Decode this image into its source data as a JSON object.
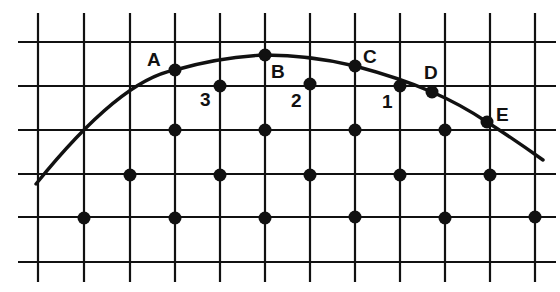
{
  "diagram": {
    "type": "grid-with-curve",
    "grid": {
      "vertical_lines_x": [
        38,
        84,
        130,
        175,
        220,
        265,
        310,
        355,
        400,
        445,
        490,
        535
      ],
      "horizontal_lines_y": [
        42,
        86,
        130,
        174,
        217,
        262
      ],
      "line_color": "#111111"
    },
    "curve": {
      "path": "M 36 184 Q 120 80 175 70 Q 220 57 265 55 Q 310 55 355 66 Q 400 78 432 92 Q 460 104 487 122 Q 515 140 543 160"
    },
    "labeled_points": [
      {
        "id": "A",
        "x": 175,
        "y": 70,
        "label_x": 147,
        "label_y": 66
      },
      {
        "id": "B",
        "x": 265,
        "y": 55,
        "label_x": 271,
        "label_y": 78
      },
      {
        "id": "C",
        "x": 355,
        "y": 66,
        "label_x": 363,
        "label_y": 63
      },
      {
        "id": "D",
        "x": 432,
        "y": 92,
        "label_x": 424,
        "label_y": 79
      },
      {
        "id": "E",
        "x": 487,
        "y": 122,
        "label_x": 496,
        "label_y": 121
      }
    ],
    "numbered_points": [
      {
        "id": "1",
        "x": 400,
        "y": 86,
        "label_x": 382,
        "label_y": 108
      },
      {
        "id": "2",
        "x": 310,
        "y": 84,
        "label_x": 291,
        "label_y": 107
      },
      {
        "id": "3",
        "x": 220,
        "y": 86,
        "label_x": 200,
        "label_y": 106
      }
    ],
    "lattice_points": [
      {
        "x": 175,
        "y": 130
      },
      {
        "x": 265,
        "y": 130
      },
      {
        "x": 355,
        "y": 130
      },
      {
        "x": 445,
        "y": 130
      },
      {
        "x": 130,
        "y": 175
      },
      {
        "x": 220,
        "y": 175
      },
      {
        "x": 310,
        "y": 175
      },
      {
        "x": 400,
        "y": 175
      },
      {
        "x": 490,
        "y": 175
      },
      {
        "x": 84,
        "y": 218
      },
      {
        "x": 175,
        "y": 218
      },
      {
        "x": 265,
        "y": 218
      },
      {
        "x": 355,
        "y": 217
      },
      {
        "x": 445,
        "y": 218
      },
      {
        "x": 535,
        "y": 217
      }
    ]
  }
}
